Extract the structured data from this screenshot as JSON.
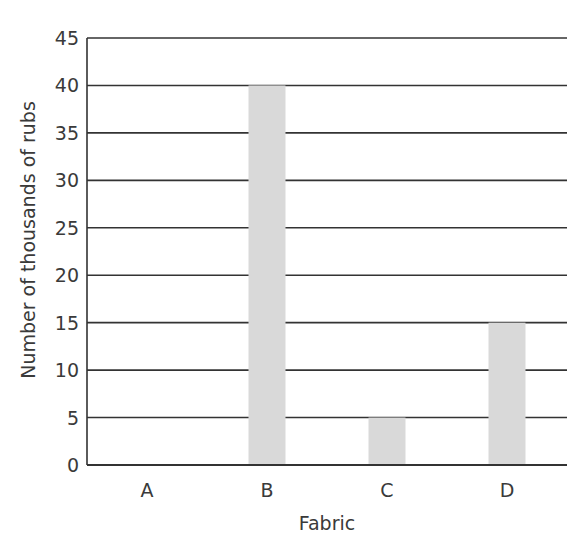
{
  "chart_data": {
    "type": "bar",
    "title": "",
    "xlabel": "Fabric",
    "ylabel": "Number of thousands of rubs",
    "categories": [
      "A",
      "B",
      "C",
      "D"
    ],
    "values": [
      0,
      40,
      5,
      15
    ],
    "ylim": [
      0,
      45
    ],
    "yticks": [
      0,
      5,
      10,
      15,
      20,
      25,
      30,
      35,
      40,
      45
    ],
    "grid": true,
    "legend": null,
    "bar_color": "#d9d9d9",
    "grid_color": "#333333"
  }
}
